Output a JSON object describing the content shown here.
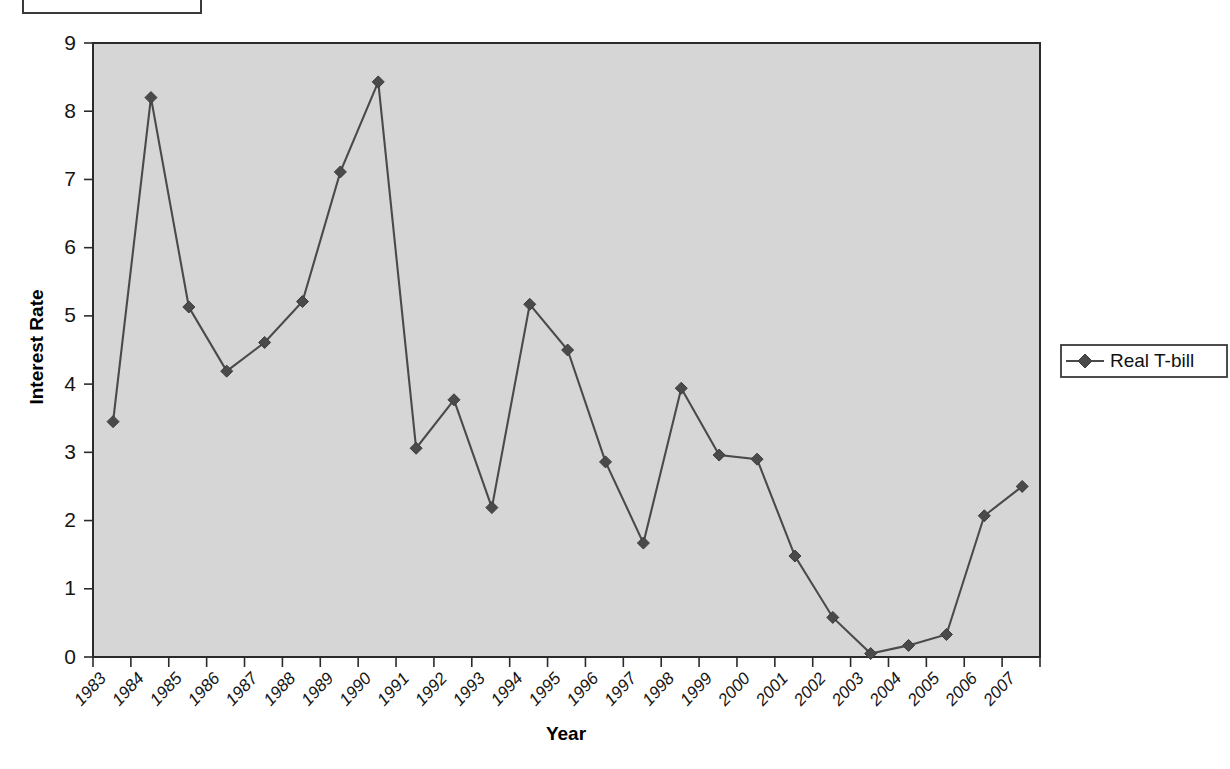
{
  "chart_data": {
    "type": "line",
    "title": "",
    "xlabel": "Year",
    "ylabel": "Interest Rate",
    "categories": [
      "1983",
      "1984",
      "1985",
      "1986",
      "1987",
      "1988",
      "1989",
      "1990",
      "1991",
      "1992",
      "1993",
      "1994",
      "1995",
      "1996",
      "1997",
      "1998",
      "1999",
      "2000",
      "2001",
      "2002",
      "2003",
      "2004",
      "2005",
      "2006",
      "2007"
    ],
    "series": [
      {
        "name": "Real T-bill",
        "values": [
          3.45,
          8.2,
          5.13,
          4.19,
          4.61,
          5.21,
          7.11,
          8.43,
          3.06,
          3.77,
          2.19,
          5.17,
          4.5,
          2.86,
          1.67,
          3.94,
          2.96,
          2.9,
          1.48,
          0.58,
          0.05,
          0.17,
          0.33,
          2.07,
          2.5
        ]
      }
    ],
    "ylim": [
      0,
      9
    ],
    "yticks": [
      0,
      1,
      2,
      3,
      4,
      5,
      6,
      7,
      8,
      9
    ],
    "grid": false,
    "legend_position": "right",
    "marker": "diamond",
    "plot_background_color": "#d6d6d6",
    "series_color": "#4a4a4a"
  },
  "legend": {
    "entries": [
      {
        "label": "Real T-bill",
        "marker": "diamond-marker"
      }
    ]
  },
  "axes": {
    "y_title": "Interest Rate",
    "x_title": "Year"
  }
}
